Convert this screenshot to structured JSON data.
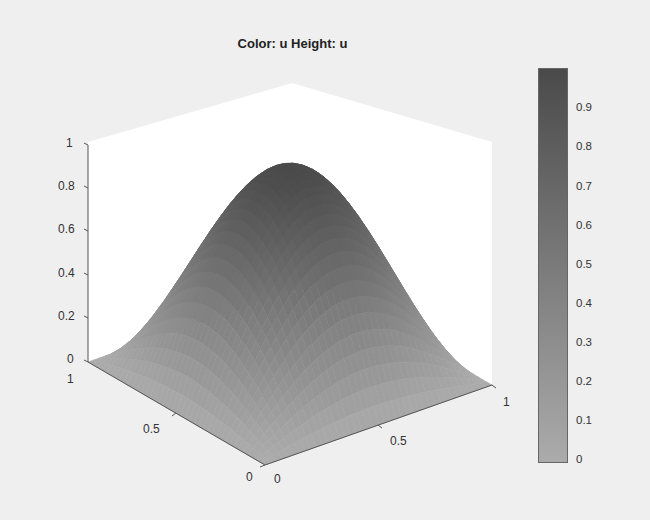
{
  "chart_data": {
    "type": "surface3d",
    "title": "Color: u  Height: u",
    "xlabel": "",
    "ylabel": "",
    "zlabel": "",
    "function_description": "smooth bump peaking at center of unit square, zero on boundary",
    "x_range": [
      0,
      1
    ],
    "y_range": [
      0,
      1
    ],
    "z_range": [
      0,
      1
    ],
    "peak": {
      "x": 0.5,
      "y": 0.5,
      "z": 0.95
    },
    "x_ticks": [
      "0",
      "0.5",
      "1"
    ],
    "y_ticks": [
      "0",
      "0.5",
      "1"
    ],
    "z_ticks": [
      "0",
      "0.2",
      "0.4",
      "0.6",
      "0.8",
      "1"
    ],
    "colorbar": {
      "range": [
        0,
        0.95
      ],
      "ticks": [
        "0",
        "0.1",
        "0.2",
        "0.3",
        "0.4",
        "0.5",
        "0.6",
        "0.7",
        "0.8",
        "0.9"
      ],
      "colormap": "gray",
      "color_low": "#ababab",
      "color_high": "#4a4a4a"
    },
    "grid": false,
    "legend": "colorbar-right"
  },
  "labels": {
    "title": "Color: u  Height: u",
    "z_ticks": [
      {
        "text": "1"
      },
      {
        "text": "0.8"
      },
      {
        "text": "0.6"
      },
      {
        "text": "0.4"
      },
      {
        "text": "0.2"
      },
      {
        "text": "0"
      }
    ],
    "y_ticks": [
      {
        "text": "1"
      },
      {
        "text": "0.5"
      },
      {
        "text": "0"
      }
    ],
    "x_ticks": [
      {
        "text": "0"
      },
      {
        "text": "0.5"
      },
      {
        "text": "1"
      }
    ],
    "cb_ticks": [
      "0.9",
      "0.8",
      "0.7",
      "0.6",
      "0.5",
      "0.4",
      "0.3",
      "0.2",
      "0.1",
      "0"
    ]
  }
}
